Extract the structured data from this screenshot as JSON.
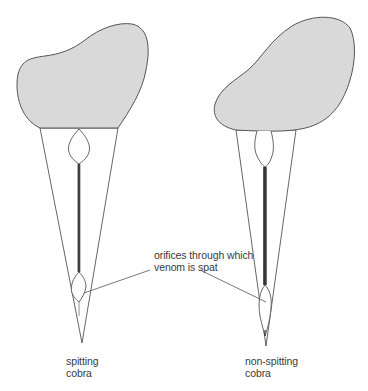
{
  "diagram": {
    "colors": {
      "root_fill": "#d9d9d9",
      "outline": "#555555",
      "canal": "#444444",
      "background": "#ffffff",
      "text": "#3a3a3a"
    },
    "annotation": {
      "line1": "orifices through which",
      "line2": "venom is spat"
    },
    "fangs": [
      {
        "id": "spitting",
        "label_line1": "spitting",
        "label_line2": "cobra"
      },
      {
        "id": "non-spitting",
        "label_line1": "non-spitting",
        "label_line2": "cobra"
      }
    ]
  }
}
